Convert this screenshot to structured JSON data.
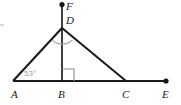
{
  "figure": {
    "kind": "geometry-diagram",
    "width": 181,
    "height": 105,
    "background_color": "#ffffff",
    "stroke_color": "#1b1b1f",
    "mark_color": "#a7a7ad",
    "label_color": "#17171a",
    "angle_label_color": "#9b9ba0"
  },
  "points": [
    {
      "id": "A",
      "label": "A",
      "x": 13,
      "y": 81,
      "label_x": 11,
      "label_y": 98,
      "has_dot": false
    },
    {
      "id": "B",
      "label": "B",
      "x": 62,
      "y": 81,
      "label_x": 58,
      "label_y": 98,
      "has_dot": false
    },
    {
      "id": "C",
      "label": "C",
      "x": 126,
      "y": 81,
      "label_x": 122,
      "label_y": 98,
      "has_dot": false
    },
    {
      "id": "E",
      "label": "E",
      "x": 166,
      "y": 81,
      "label_x": 162,
      "label_y": 98,
      "has_dot": true
    },
    {
      "id": "D",
      "label": "D",
      "x": 62,
      "y": 28,
      "label_x": 66,
      "label_y": 24,
      "has_dot": false
    },
    {
      "id": "F",
      "label": "F",
      "x": 62,
      "y": 4,
      "label_x": 66,
      "label_y": 10,
      "has_dot": true
    }
  ],
  "segments": [
    {
      "name": "base-line-AE",
      "from": "A",
      "to": "E",
      "weight": "thick"
    },
    {
      "name": "side-AD",
      "from": "A",
      "to": "D",
      "weight": "thick"
    },
    {
      "name": "side-DC",
      "from": "D",
      "to": "C",
      "weight": "thick"
    },
    {
      "name": "altitude-BD",
      "from": "B",
      "to": "D",
      "weight": "med"
    },
    {
      "name": "ray-DF",
      "from": "D",
      "to": "F",
      "weight": "med"
    }
  ],
  "angle_marks": [
    {
      "name": "angle-ADB-arc",
      "at": "D",
      "type": "arc",
      "note": "arc between segment DA and segment DB"
    },
    {
      "name": "angle-BDC-arc",
      "at": "D",
      "type": "arc",
      "note": "arc between segment DB and segment DC"
    },
    {
      "name": "right-angle-DBC",
      "at": "B",
      "type": "square",
      "note": "right angle square mark between BD and BC"
    }
  ],
  "angle_labels": [
    {
      "name": "angle-A-measure",
      "at": "A",
      "text": "53°",
      "x": 24,
      "y": 76
    }
  ]
}
